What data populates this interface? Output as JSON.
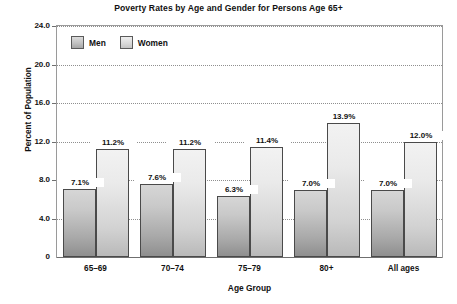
{
  "chart_data": {
    "type": "bar",
    "title": "Poverty Rates by Age and Gender for Persons Age 65+",
    "xlabel": "Age Group",
    "ylabel": "Percent of Population",
    "categories": [
      "65–69",
      "70–74",
      "75–79",
      "80+",
      "All ages"
    ],
    "series": [
      {
        "name": "Men",
        "values": [
          7.1,
          7.6,
          6.3,
          7.0,
          7.0
        ],
        "color": "#b4b4b4"
      },
      {
        "name": "Women",
        "values": [
          11.2,
          11.2,
          11.4,
          13.9,
          12.0
        ],
        "color": "#dcdcdc"
      }
    ],
    "value_labels": [
      [
        "7.1%",
        "7.6%",
        "6.3%",
        "7.0%",
        "7.0%"
      ],
      [
        "11.2%",
        "11.2%",
        "11.4%",
        "13.9%",
        "12.0%"
      ]
    ],
    "ylim": [
      0,
      24
    ],
    "ytick_values": [
      0,
      4,
      8,
      12,
      16,
      20,
      24
    ],
    "ytick_labels": [
      "0",
      "4.0",
      "8.0",
      "12.0",
      "16.0",
      "20.0",
      "24.0"
    ],
    "grid": true,
    "legend_position": "top-left-inside",
    "value_label_suffix": "%"
  },
  "legend": {
    "items": [
      {
        "label": "Men",
        "swatch": "men-swatch"
      },
      {
        "label": "Women",
        "swatch": "women-swatch"
      }
    ]
  }
}
